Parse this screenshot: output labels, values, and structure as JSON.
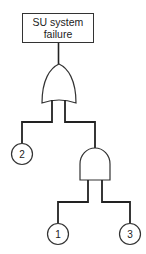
{
  "diagram": {
    "type": "fault-tree",
    "top_event": {
      "line1": "SU system",
      "line2": "failure"
    },
    "gates": [
      {
        "id": "or-gate",
        "type": "OR"
      },
      {
        "id": "and-gate",
        "type": "AND"
      }
    ],
    "basic_events": [
      {
        "id": "event-2",
        "label": "2"
      },
      {
        "id": "event-1",
        "label": "1"
      },
      {
        "id": "event-3",
        "label": "3"
      }
    ]
  }
}
